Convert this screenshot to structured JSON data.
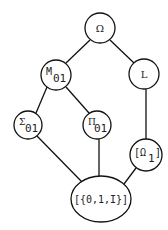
{
  "diagram": {
    "type": "lattice / Hasse diagram",
    "nodes": [
      {
        "id": "omega",
        "label": "Ω",
        "sub": "",
        "shape": "circle",
        "cx": 100,
        "cy": 28,
        "r": 15
      },
      {
        "id": "m01",
        "label": "M",
        "sub": "01",
        "shape": "circle",
        "cx": 56,
        "cy": 75,
        "r": 15
      },
      {
        "id": "l",
        "label": "L",
        "sub": "",
        "shape": "circle",
        "cx": 144,
        "cy": 74,
        "r": 15
      },
      {
        "id": "sigma01",
        "label": "Σ",
        "sub": "01",
        "shape": "circle",
        "cx": 28,
        "cy": 125,
        "r": 14
      },
      {
        "id": "pi01",
        "label": "Π",
        "sub": "01",
        "shape": "circle",
        "cx": 97,
        "cy": 125,
        "r": 14
      },
      {
        "id": "omega1",
        "label": "[Ω",
        "sub": "1",
        "suffix": "]",
        "shape": "circle",
        "cx": 146,
        "cy": 155,
        "r": 16
      },
      {
        "id": "bottom",
        "label": "[{0,1,I}]",
        "sub": "",
        "shape": "ellipse",
        "cx": 101,
        "cy": 199,
        "rx": 30,
        "ry": 23
      }
    ],
    "edges": [
      {
        "from": "omega",
        "to": "m01"
      },
      {
        "from": "omega",
        "to": "l"
      },
      {
        "from": "m01",
        "to": "sigma01"
      },
      {
        "from": "m01",
        "to": "pi01"
      },
      {
        "from": "l",
        "to": "omega1"
      },
      {
        "from": "sigma01",
        "to": "bottom"
      },
      {
        "from": "pi01",
        "to": "bottom"
      },
      {
        "from": "omega1",
        "to": "bottom"
      }
    ],
    "labels": {
      "omega": "Ω",
      "m01_main": "M",
      "m01_sub": "01",
      "l": "L",
      "sigma01_main": "Σ",
      "sigma01_sub": "01",
      "pi01_main": "Π",
      "pi01_sub": "01",
      "omega1_open": "[Ω",
      "omega1_sub": "1",
      "omega1_close": "]",
      "bottom": "[{0,1,I}]"
    }
  }
}
